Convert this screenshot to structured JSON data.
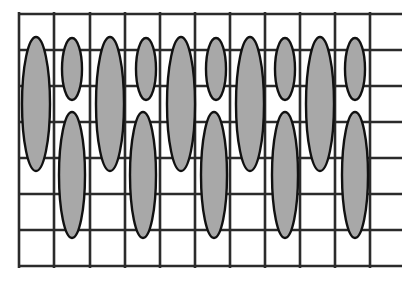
{
  "figure": {
    "canvas": {
      "width": 409,
      "height": 285,
      "background": "#ffffff"
    },
    "colors": {
      "grid_stroke": "#2b2b2b",
      "ellipse_fill": "#a8a8a8",
      "ellipse_stroke": "#111111",
      "background": "#ffffff"
    },
    "grid": {
      "label": "rectangular-grid",
      "stroke_width": 2.6,
      "vertical_lines": {
        "count": 11,
        "x_positions": [
          19,
          54,
          90,
          125,
          160,
          195,
          230,
          265,
          300,
          335,
          370
        ],
        "y_start": 12,
        "y_end": 268
      },
      "horizontal_lines": {
        "count": 8,
        "y_positions": [
          14,
          50,
          86,
          122,
          158,
          194,
          230,
          266
        ],
        "x_start": 18,
        "x_end": 402
      }
    },
    "ellipses": {
      "label": "shaded-ellipse-set",
      "stroke_width": 2.4,
      "rows": [
        {
          "name": "upper-row",
          "items": [
            {
              "id": "u1",
              "cx": 36,
              "cy": 104,
              "rx": 14,
              "ry": 67,
              "size": "tall"
            },
            {
              "id": "u2",
              "cx": 72,
              "cy": 69,
              "rx": 10,
              "ry": 31,
              "size": "short"
            },
            {
              "id": "u3",
              "cx": 110,
              "cy": 104,
              "rx": 14,
              "ry": 67,
              "size": "tall"
            },
            {
              "id": "u4",
              "cx": 146,
              "cy": 69,
              "rx": 10,
              "ry": 31,
              "size": "short"
            },
            {
              "id": "u5",
              "cx": 181,
              "cy": 104,
              "rx": 14,
              "ry": 67,
              "size": "tall"
            },
            {
              "id": "u6",
              "cx": 216,
              "cy": 69,
              "rx": 10,
              "ry": 31,
              "size": "short"
            },
            {
              "id": "u7",
              "cx": 250,
              "cy": 104,
              "rx": 14,
              "ry": 67,
              "size": "tall"
            },
            {
              "id": "u8",
              "cx": 285,
              "cy": 69,
              "rx": 10,
              "ry": 31,
              "size": "short"
            },
            {
              "id": "u9",
              "cx": 320,
              "cy": 104,
              "rx": 14,
              "ry": 67,
              "size": "tall"
            },
            {
              "id": "u10",
              "cx": 355,
              "cy": 69,
              "rx": 10,
              "ry": 31,
              "size": "short"
            }
          ]
        },
        {
          "name": "lower-row",
          "items": [
            {
              "id": "l1",
              "cx": 72,
              "cy": 175,
              "rx": 13,
              "ry": 63,
              "size": "tall"
            },
            {
              "id": "l2",
              "cx": 143,
              "cy": 175,
              "rx": 13,
              "ry": 63,
              "size": "tall"
            },
            {
              "id": "l3",
              "cx": 214,
              "cy": 175,
              "rx": 13,
              "ry": 63,
              "size": "tall"
            },
            {
              "id": "l4",
              "cx": 285,
              "cy": 175,
              "rx": 13,
              "ry": 63,
              "size": "tall"
            },
            {
              "id": "l5",
              "cx": 355,
              "cy": 175,
              "rx": 13,
              "ry": 63,
              "size": "tall"
            }
          ]
        }
      ]
    }
  }
}
